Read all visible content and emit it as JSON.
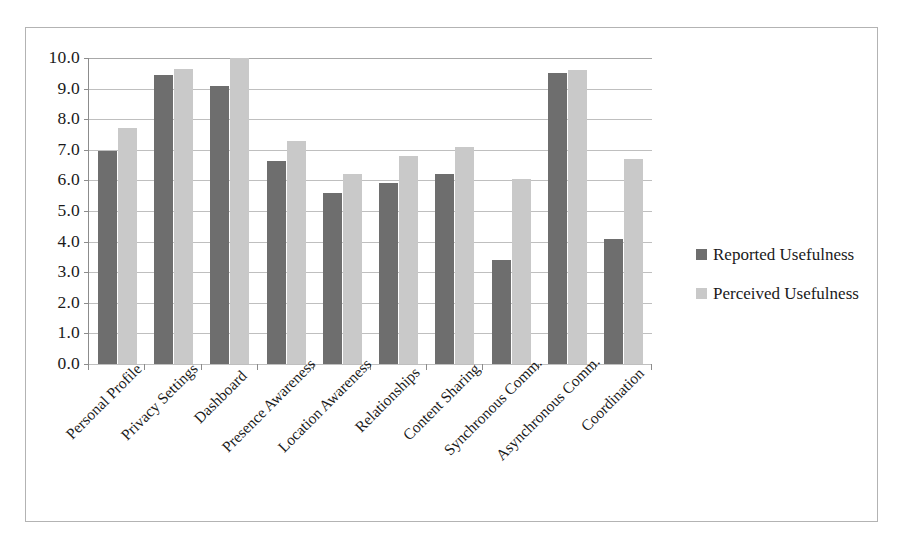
{
  "chart_data": {
    "type": "bar",
    "title": "",
    "subtitle": "",
    "xlabel": "",
    "ylabel": "",
    "ylim": [
      0.0,
      10.0
    ],
    "y_tick_step": 1.0,
    "grid": true,
    "legend_position": "right",
    "orientation": "vertical",
    "grouping": "grouped",
    "categories": [
      "Personal Profile",
      "Privacy Settings",
      "Dashboard",
      "Presence Awareness",
      "Location Awareness",
      "Relationships",
      "Content Sharing",
      "Synchronous Comm.",
      "Asynchronous Comm.",
      "Coordination"
    ],
    "y_tick_labels": [
      "10.0",
      "9.0",
      "8.0",
      "7.0",
      "6.0",
      "5.0",
      "4.0",
      "3.0",
      "2.0",
      "1.0",
      "0.0"
    ],
    "series": [
      {
        "name": "Reported Usefulness",
        "color": "#6e6e6e",
        "values": [
          6.95,
          9.45,
          9.1,
          6.65,
          5.6,
          5.9,
          6.2,
          3.4,
          9.5,
          4.1
        ]
      },
      {
        "name": "Perceived Usefulness",
        "color": "#c9c9c9",
        "values": [
          7.7,
          9.65,
          10.0,
          7.3,
          6.2,
          6.8,
          7.1,
          6.05,
          9.6,
          6.7
        ]
      }
    ]
  },
  "legend": {
    "entries": [
      {
        "label": "Reported Usefulness",
        "swatch": "reported"
      },
      {
        "label": "Perceived Usefulness",
        "swatch": "perceived"
      }
    ]
  },
  "colors": {
    "reported": "#6e6e6e",
    "perceived": "#c9c9c9",
    "gridline": "#bfbfbf",
    "axis": "#8c8c8c",
    "frame": "#b3b3b3",
    "background": "#ffffff",
    "text": "#1a1a1a"
  }
}
